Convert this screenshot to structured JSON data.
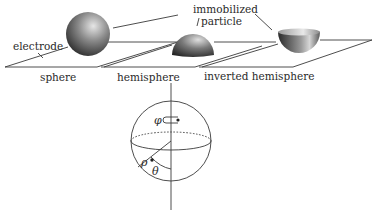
{
  "figure": {
    "electrode_label": "electrode",
    "particle_label_line1": "immobilized",
    "particle_label_line2": "particle",
    "geometries": [
      {
        "id": "sphere",
        "label": "sphere"
      },
      {
        "id": "hemisphere",
        "label": "hemisphere"
      },
      {
        "id": "inverted-hemisphere",
        "label": "inverted hemisphere"
      }
    ],
    "coordinate_system": {
      "phi": "φ",
      "rho": "ρ",
      "theta": "θ"
    }
  },
  "colors": {
    "line": "#3a3a3a",
    "particle_light": "#d8d8d8",
    "particle_dark": "#2e2e2e",
    "background": "#ffffff"
  }
}
